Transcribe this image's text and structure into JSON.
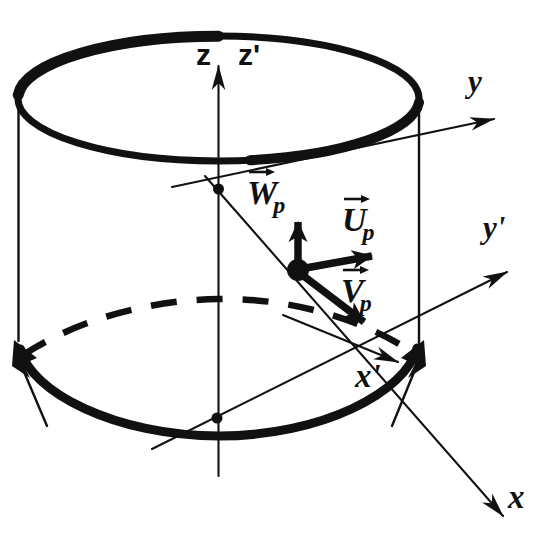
{
  "figure": {
    "background_color": "#ffffff",
    "ink_color": "#111111"
  },
  "axes": [
    {
      "id": "z",
      "label": "z",
      "prime": false,
      "description": "vertical axis of unprimed frame, points up along cylinder axis"
    },
    {
      "id": "z-prime",
      "label": "z'",
      "prime": true,
      "description": "vertical axis of primed frame, coincident with z"
    },
    {
      "id": "y",
      "label": "y",
      "prime": false,
      "description": "upper right axis of unprimed frame"
    },
    {
      "id": "y-prime",
      "label": "y'",
      "prime": true,
      "description": "lower right axis of primed frame"
    },
    {
      "id": "x",
      "label": "x",
      "prime": false,
      "description": "far lower right axis of unprimed frame"
    },
    {
      "id": "x-prime",
      "label": "x'",
      "prime": true,
      "description": "short axis toward lower right inside cylinder"
    }
  ],
  "vectors": [
    {
      "id": "w-p",
      "base": "W",
      "subscript": "p",
      "label": "W⃗p",
      "direction": "up",
      "description": "vertical component vector at point p"
    },
    {
      "id": "u-p",
      "base": "U",
      "subscript": "p",
      "label": "U⃗p",
      "direction": "right",
      "description": "horizontal component vector at point p"
    },
    {
      "id": "v-p",
      "base": "V",
      "subscript": "p",
      "label": "V⃗p",
      "direction": "down-right",
      "description": "component vector at point p toward x-prime"
    }
  ],
  "markers": [
    {
      "id": "point-p",
      "description": "large filled dot at vector origin, point p"
    },
    {
      "id": "node-upper-axis",
      "description": "small filled dot where y axis crosses z axis near top disc"
    },
    {
      "id": "node-lower-axis",
      "description": "small filled dot where x and x-prime axes cross z axis at base"
    }
  ],
  "shapes": [
    {
      "id": "cylinder-top-ellipse",
      "description": "heavy ellipse forming top rim of cylinder"
    },
    {
      "id": "cylinder-bottom-arc",
      "description": "heavy front arc forming bottom rim of cylinder"
    },
    {
      "id": "cylinder-bottom-hidden",
      "description": "dashed hidden back arc of bottom rim"
    },
    {
      "id": "cylinder-wall-left",
      "description": "thin vertical line, left silhouette of cylinder"
    },
    {
      "id": "cylinder-wall-right",
      "description": "thin vertical line, right silhouette of cylinder"
    },
    {
      "id": "rotation-arrow-left",
      "description": "arrowhead at left end of bottom rim indicating rotation"
    },
    {
      "id": "rotation-arrow-right",
      "description": "arrowhead at right end of bottom rim indicating rotation"
    }
  ]
}
